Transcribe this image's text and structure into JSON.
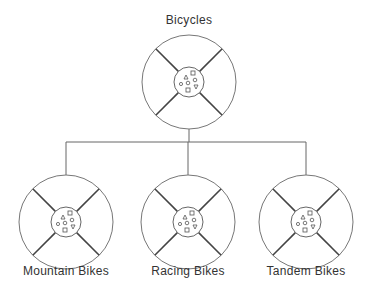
{
  "diagram": {
    "root": {
      "label": "Bicycles",
      "cx": 189,
      "cy": 82,
      "label_y": 13
    },
    "children": [
      {
        "label": "Mountain Bikes",
        "cx": 66,
        "cy": 222,
        "label_y": 264
      },
      {
        "label": "Racing Bikes",
        "cx": 188,
        "cy": 222,
        "label_y": 264
      },
      {
        "label": "Tandem Bikes",
        "cx": 306,
        "cy": 222,
        "label_y": 264
      }
    ],
    "connector_y": 142,
    "wheel_radius": 47,
    "hub_radius": 15,
    "stroke_color": "#555555"
  }
}
